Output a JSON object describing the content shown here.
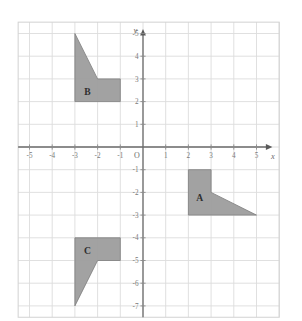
{
  "figure": {
    "background_color": "#ffffff",
    "grid_color": "#dcdcdc",
    "axis_color": "#6b6b6b",
    "shape_fill_color": "#9d9d9d",
    "shape_stroke_color": "#7d7d7d",
    "label_color": "#7a7a7a"
  },
  "axes": {
    "x_axis_name": "x",
    "y_axis_name": "y",
    "origin_label": "O",
    "x_ticks": [
      {
        "value": -5,
        "label": "-5"
      },
      {
        "value": -4,
        "label": "-4"
      },
      {
        "value": -3,
        "label": "-3"
      },
      {
        "value": -2,
        "label": "-2"
      },
      {
        "value": -1,
        "label": "-1"
      },
      {
        "value": 1,
        "label": "1"
      },
      {
        "value": 2,
        "label": "2"
      },
      {
        "value": 3,
        "label": "3"
      },
      {
        "value": 4,
        "label": "4"
      },
      {
        "value": 5,
        "label": "5"
      }
    ],
    "y_ticks": [
      {
        "value": 5,
        "label": "5"
      },
      {
        "value": 4,
        "label": "4"
      },
      {
        "value": 3,
        "label": "3"
      },
      {
        "value": 2,
        "label": "2"
      },
      {
        "value": 1,
        "label": "1"
      },
      {
        "value": -1,
        "label": "-1"
      },
      {
        "value": -2,
        "label": "-2"
      },
      {
        "value": -3,
        "label": "-3"
      },
      {
        "value": -4,
        "label": "-4"
      },
      {
        "value": -5,
        "label": "-5"
      },
      {
        "value": -6,
        "label": "-6"
      },
      {
        "value": -7,
        "label": "-7"
      }
    ],
    "x_range": [
      -5.5,
      6.0
    ],
    "y_range": [
      -7.5,
      5.5
    ],
    "grid_spacing": 1
  },
  "chart_data": {
    "type": "scatter",
    "xlabel": "x",
    "ylabel": "y",
    "xlim": [
      -5.5,
      6.0
    ],
    "ylim": [
      -7.5,
      5.5
    ],
    "grid": true,
    "legend": "none",
    "shapes": [
      {
        "name": "A",
        "label": "A",
        "label_position": {
          "x": 2.5,
          "y": -2.25
        },
        "vertices": [
          {
            "x": 2,
            "y": -1
          },
          {
            "x": 3,
            "y": -1
          },
          {
            "x": 3,
            "y": -2
          },
          {
            "x": 5,
            "y": -3
          },
          {
            "x": 2,
            "y": -3
          }
        ]
      },
      {
        "name": "B",
        "label": "B",
        "label_position": {
          "x": -2.45,
          "y": 2.45
        },
        "vertices": [
          {
            "x": -3,
            "y": 5
          },
          {
            "x": -2,
            "y": 3
          },
          {
            "x": -1,
            "y": 3
          },
          {
            "x": -1,
            "y": 2
          },
          {
            "x": -3,
            "y": 2
          }
        ]
      },
      {
        "name": "C",
        "label": "C",
        "label_position": {
          "x": -2.45,
          "y": -4.55
        },
        "vertices": [
          {
            "x": -3,
            "y": -4
          },
          {
            "x": -1,
            "y": -4
          },
          {
            "x": -1,
            "y": -5
          },
          {
            "x": -2,
            "y": -5
          },
          {
            "x": -3,
            "y": -7
          }
        ]
      }
    ]
  }
}
